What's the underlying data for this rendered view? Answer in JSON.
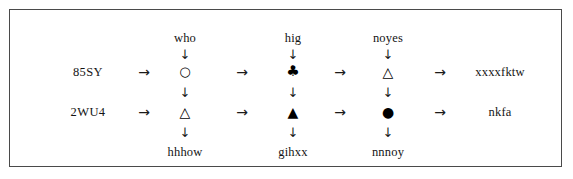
{
  "figure": {
    "rows": [
      {
        "id": "row-1",
        "label": "85SY",
        "top_labels": [
          "who",
          "hig",
          "noyes"
        ],
        "symbols": [
          {
            "name": "circle-open",
            "glyph": "○"
          },
          {
            "name": "club-filled",
            "glyph": "♣"
          },
          {
            "name": "triangle-open",
            "glyph": "△"
          }
        ],
        "output": "xxxxfktw"
      },
      {
        "id": "row-2",
        "label": "2WU4",
        "bottom_labels": [
          "hhhow",
          "gihxx",
          "nnnoy"
        ],
        "symbols": [
          {
            "name": "triangle-open",
            "glyph": "△"
          },
          {
            "name": "triangle-filled",
            "glyph": "▲"
          },
          {
            "name": "circle-filled",
            "glyph": "●"
          }
        ],
        "output": "nkfa"
      }
    ],
    "arrows": {
      "right": "→",
      "down": "↓"
    },
    "colors": {
      "border": "#4a4a4a",
      "text": "#141414",
      "symbol": "#000000",
      "background": "#ffffff"
    }
  }
}
